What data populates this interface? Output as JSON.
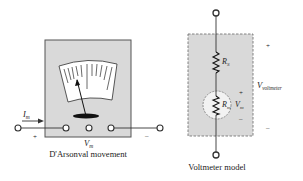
{
  "colors": {
    "box_fill": "#d9d9d9",
    "box_stroke": "#555555",
    "dial_fill": "#ffffff",
    "wire": "#333333",
    "circle_fill": "#f2f2f2",
    "text": "#222222"
  },
  "left_figure": {
    "caption": "D'Arsonval movement",
    "current_label_main": "I",
    "current_label_sub": "m",
    "voltage_label_main": "V",
    "voltage_label_sub": "m",
    "plus_sign": "+",
    "minus_sign": "–"
  },
  "right_figure": {
    "caption": "Voltmeter model",
    "series_resistor_main": "R",
    "series_resistor_sub": "S",
    "movement_resistor_main": "R",
    "movement_resistor_sub": "m",
    "movement_voltage_main": "V",
    "movement_voltage_sub": "m",
    "movement_plus": "+",
    "movement_minus": "–",
    "voltmeter_voltage_main": "V",
    "voltmeter_voltage_sub": "voltmeter",
    "outer_plus": "+",
    "outer_minus": "–"
  }
}
